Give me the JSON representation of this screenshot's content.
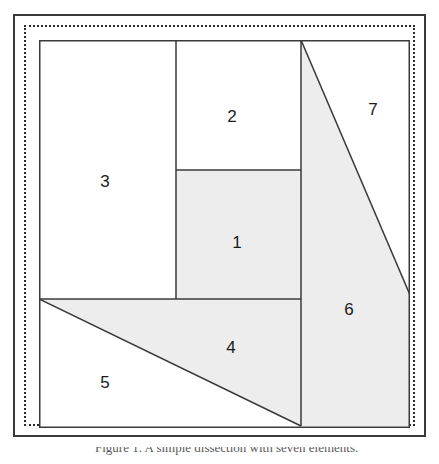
{
  "figure": {
    "shaded_fill": "#ededed",
    "stroke_color": "#3a3a3a",
    "background": "#ffffff",
    "frame": {
      "outer_border_style": "solid",
      "inner_border_style": "dotted"
    },
    "canvas": {
      "width": 371,
      "height": 388
    },
    "regions": [
      {
        "id": "region-1",
        "label": "1",
        "shape": "rectangle",
        "shaded": true,
        "points": "137,130 262,130 262,259 137,259",
        "label_x": 198,
        "label_y": 202
      },
      {
        "id": "region-2",
        "label": "2",
        "shape": "rectangle",
        "shaded": false,
        "points": "137,0 262,0 262,130 137,130",
        "label_x": 193,
        "label_y": 76
      },
      {
        "id": "region-3",
        "label": "3",
        "shape": "rectangle",
        "shaded": false,
        "points": "0,0 137,0 137,259 0,259",
        "label_x": 66,
        "label_y": 141
      },
      {
        "id": "region-4",
        "label": "4",
        "shape": "triangle",
        "shaded": true,
        "points": "0,259 262,259 262,386",
        "label_x": 192,
        "label_y": 307
      },
      {
        "id": "region-5",
        "label": "5",
        "shape": "triangle",
        "shaded": false,
        "points": "0,259 262,386 0,386",
        "label_x": 66,
        "label_y": 342
      },
      {
        "id": "region-6",
        "label": "6",
        "shape": "quadrilateral",
        "shaded": true,
        "points": "262,0 371,255 371,386 262,386",
        "label_x": 310,
        "label_y": 269
      },
      {
        "id": "region-7",
        "label": "7",
        "shape": "triangle",
        "shaded": false,
        "points": "262,0 371,0 371,255",
        "label_x": 334,
        "label_y": 69
      }
    ]
  },
  "caption": {
    "text": "Figure 1. A simple dissection with seven elements."
  }
}
